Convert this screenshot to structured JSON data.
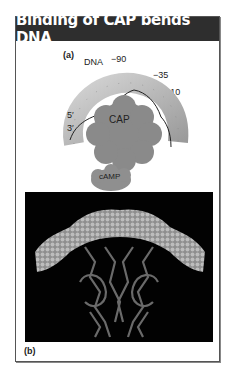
{
  "figure": {
    "title": "Binding of CAP bends DNA",
    "panel_a": {
      "label": "(a)",
      "dna_label": "DNA",
      "positions": [
        "−90",
        "−35",
        "−10"
      ],
      "strand_ends": [
        "5′",
        "3′"
      ],
      "protein_label": "CAP",
      "ligand_label": "cAMP"
    },
    "panel_b": {
      "label": "(b)",
      "description": "Space-filling DNA bent over ribbon model of CAP dimer"
    },
    "colors": {
      "header_bg": "#2e2e2e",
      "dna": "#b5b5b5",
      "cap": "#8a8a8a",
      "camp": "#8f8f8f",
      "panel_b_bg": "#020202"
    }
  }
}
